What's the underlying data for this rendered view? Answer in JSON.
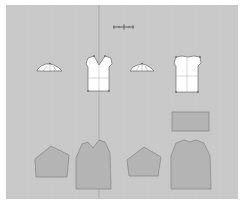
{
  "app": {
    "type": "garment-pattern-cad-canvas"
  },
  "canvas": {
    "background": "#c9c9c9",
    "grid_color": "#bdbdbd",
    "center_guide_x": 99,
    "ruler": {
      "label": ""
    }
  },
  "pieces": {
    "top_row": [
      {
        "name": "front-collar-piece",
        "fill": "#ffffff",
        "outline": "#555555"
      },
      {
        "name": "front-bodice-piece",
        "fill": "#ffffff",
        "outline": "#555555"
      },
      {
        "name": "back-collar-piece",
        "fill": "#ffffff",
        "outline": "#555555"
      },
      {
        "name": "back-bodice-piece",
        "fill": "#ffffff",
        "outline": "#555555"
      }
    ],
    "bottom_row": [
      {
        "name": "sleeve-piece-left",
        "fill": "#b4b4b4",
        "outline": "#8a8a8a"
      },
      {
        "name": "front-panel-piece",
        "fill": "#b4b4b4",
        "outline": "#8a8a8a"
      },
      {
        "name": "sleeve-piece-right",
        "fill": "#b4b4b4",
        "outline": "#8a8a8a"
      },
      {
        "name": "back-panel-piece",
        "fill": "#b4b4b4",
        "outline": "#8a8a8a"
      },
      {
        "name": "waistband-piece",
        "fill": "#b4b4b4",
        "outline": "#8a8a8a"
      }
    ]
  }
}
